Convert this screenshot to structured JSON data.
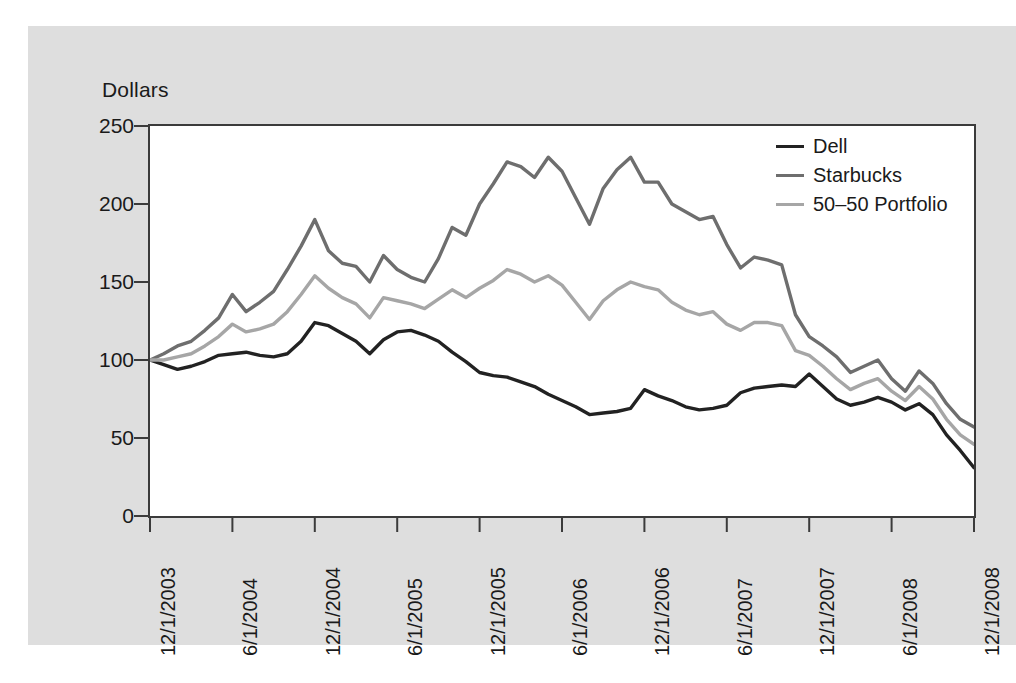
{
  "figure": {
    "background_color": "#ffffff",
    "panel_color": "#dedede",
    "plot_background_color": "#ffffff",
    "frame_color": "#3b3b3b"
  },
  "axis_title": "Dollars",
  "legend": {
    "items": [
      {
        "label": "Dell",
        "color": "#222222",
        "width": 3.4
      },
      {
        "label": "Starbucks",
        "color": "#6e6e6e",
        "width": 3.4
      },
      {
        "label": "50–50 Portfolio",
        "color": "#a6a6a6",
        "width": 3.4
      }
    ]
  },
  "chart_data": {
    "type": "line",
    "title": "",
    "xlabel": "",
    "ylabel": "Dollars",
    "ylim": [
      0,
      250
    ],
    "yticks": [
      0,
      50,
      100,
      150,
      200,
      250
    ],
    "ytick_labels": [
      "0",
      "50",
      "100",
      "150",
      "200",
      "250"
    ],
    "grid": false,
    "legend_position": "top-right",
    "xtick_labels": [
      "12/1/2003",
      "6/1/2004",
      "12/1/2004",
      "6/1/2005",
      "12/1/2005",
      "6/1/2006",
      "12/1/2006",
      "6/1/2007",
      "12/1/2007",
      "6/1/2008",
      "12/1/2008"
    ],
    "xtick_indices": [
      0,
      6,
      12,
      18,
      24,
      30,
      36,
      42,
      48,
      54,
      60
    ],
    "x": [
      "12/1/2003",
      "1/1/2004",
      "2/1/2004",
      "3/1/2004",
      "4/1/2004",
      "5/1/2004",
      "6/1/2004",
      "7/1/2004",
      "8/1/2004",
      "9/1/2004",
      "10/1/2004",
      "11/1/2004",
      "12/1/2004",
      "1/1/2005",
      "2/1/2005",
      "3/1/2005",
      "4/1/2005",
      "5/1/2005",
      "6/1/2005",
      "7/1/2005",
      "8/1/2005",
      "9/1/2005",
      "10/1/2005",
      "11/1/2005",
      "12/1/2005",
      "1/1/2006",
      "2/1/2006",
      "3/1/2006",
      "4/1/2006",
      "5/1/2006",
      "6/1/2006",
      "7/1/2006",
      "8/1/2006",
      "9/1/2006",
      "10/1/2006",
      "11/1/2006",
      "12/1/2006",
      "1/1/2007",
      "2/1/2007",
      "3/1/2007",
      "4/1/2007",
      "5/1/2007",
      "6/1/2007",
      "7/1/2007",
      "8/1/2007",
      "9/1/2007",
      "10/1/2007",
      "11/1/2007",
      "12/1/2007",
      "1/1/2008",
      "2/1/2008",
      "3/1/2008",
      "4/1/2008",
      "5/1/2008",
      "6/1/2008",
      "7/1/2008",
      "8/1/2008",
      "9/1/2008",
      "10/1/2008",
      "11/1/2008",
      "12/1/2008"
    ],
    "series": [
      {
        "name": "Dell",
        "color": "#222222",
        "values": [
          100,
          97,
          94,
          96,
          99,
          103,
          104,
          105,
          103,
          102,
          104,
          112,
          124,
          122,
          117,
          112,
          104,
          113,
          118,
          119,
          116,
          112,
          105,
          99,
          92,
          90,
          89,
          86,
          83,
          78,
          74,
          70,
          65,
          66,
          67,
          69,
          81,
          77,
          74,
          70,
          68,
          69,
          71,
          79,
          82,
          83,
          84,
          83,
          91,
          83,
          75,
          71,
          73,
          76,
          73,
          68,
          72,
          65,
          52,
          42,
          31
        ]
      },
      {
        "name": "Starbucks",
        "color": "#6e6e6e",
        "values": [
          100,
          104,
          109,
          112,
          119,
          127,
          142,
          131,
          137,
          144,
          158,
          173,
          190,
          170,
          162,
          160,
          150,
          167,
          158,
          153,
          150,
          165,
          185,
          180,
          200,
          213,
          227,
          224,
          217,
          230,
          221,
          204,
          187,
          210,
          222,
          230,
          214,
          214,
          200,
          195,
          190,
          192,
          174,
          159,
          166,
          164,
          161,
          129,
          115,
          109,
          102,
          92,
          96,
          100,
          88,
          80,
          93,
          85,
          72,
          62,
          57
        ]
      },
      {
        "name": "50–50 Portfolio",
        "color": "#a6a6a6",
        "values": [
          100,
          100,
          102,
          104,
          109,
          115,
          123,
          118,
          120,
          123,
          131,
          142,
          154,
          146,
          140,
          136,
          127,
          140,
          138,
          136,
          133,
          139,
          145,
          140,
          146,
          151,
          158,
          155,
          150,
          154,
          148,
          137,
          126,
          138,
          145,
          150,
          147,
          145,
          137,
          132,
          129,
          131,
          123,
          119,
          124,
          124,
          122,
          106,
          103,
          96,
          88,
          81,
          85,
          88,
          80,
          74,
          83,
          75,
          62,
          52,
          46
        ]
      }
    ]
  }
}
